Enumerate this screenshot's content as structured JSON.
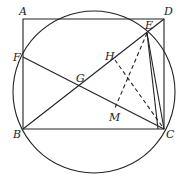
{
  "diagram": {
    "type": "geometry",
    "points": {
      "A": {
        "label": "A",
        "x": 23,
        "y": 19
      },
      "B": {
        "label": "B",
        "x": 23,
        "y": 129
      },
      "C": {
        "label": "C",
        "x": 164,
        "y": 129
      },
      "D": {
        "label": "D",
        "x": 164,
        "y": 19
      },
      "E": {
        "label": "E",
        "x": 147,
        "y": 33
      },
      "F": {
        "label": "F",
        "x": 23,
        "y": 57
      },
      "G": {
        "label": "G",
        "x": 78,
        "y": 88
      },
      "H": {
        "label": "H",
        "x": 115,
        "y": 60
      },
      "M": {
        "label": "M",
        "x": 115,
        "y": 108
      }
    },
    "circle": {
      "cx": 94,
      "cy": 92,
      "r": 81
    },
    "solid_segments": [
      "AB",
      "AD",
      "DC",
      "BC",
      "BE",
      "FC",
      "EC",
      "DB"
    ],
    "dashed_segments": [
      "HC",
      "EM"
    ],
    "line_color": "#222222"
  }
}
